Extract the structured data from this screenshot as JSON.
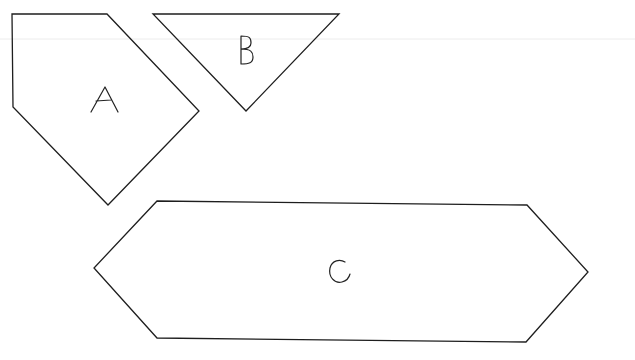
{
  "diagram": {
    "background": "#ffffff",
    "stroke_color": "#1e1e1e",
    "shapes": [
      {
        "id": "A",
        "label": "A",
        "type": "pentagon",
        "points": [
          [
            12,
            14
          ],
          [
            107,
            14
          ],
          [
            199,
            111
          ],
          [
            108,
            205
          ],
          [
            13,
            107
          ]
        ],
        "label_pos": [
          104,
          100
        ]
      },
      {
        "id": "B",
        "label": "B",
        "type": "triangle",
        "points": [
          [
            153,
            14
          ],
          [
            339,
            14
          ],
          [
            246,
            111
          ]
        ],
        "label_pos": [
          246,
          50
        ]
      },
      {
        "id": "C",
        "label": "C",
        "type": "hexagon",
        "points": [
          [
            157,
            201
          ],
          [
            527,
            205
          ],
          [
            588,
            272
          ],
          [
            526,
            342
          ],
          [
            157,
            338
          ],
          [
            94,
            268
          ]
        ],
        "label_pos": [
          339,
          272
        ]
      }
    ]
  }
}
